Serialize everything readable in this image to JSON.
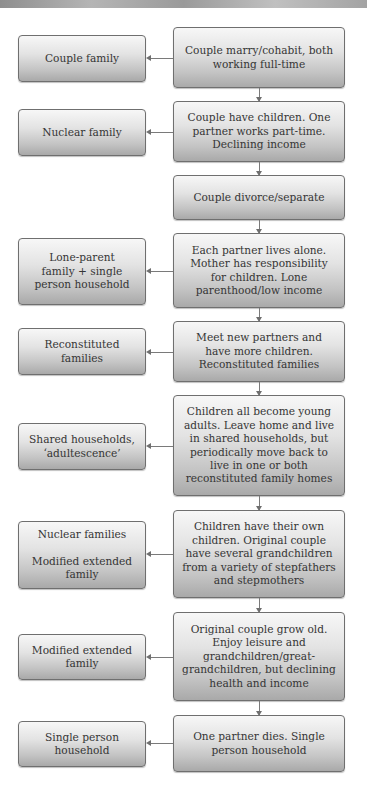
{
  "diagram": {
    "type": "flowchart",
    "stages": [
      {
        "stage": "Couple marry/cohabit, both\nworking full-time",
        "family_type": "Couple family"
      },
      {
        "stage": "Couple have children. One\npartner works part-time.\nDeclining income",
        "family_type": "Nuclear family"
      },
      {
        "stage": "Couple divorce/separate",
        "family_type": null
      },
      {
        "stage": "Each partner lives alone.\nMother has responsibility\nfor children. Lone\nparenthood/low income",
        "family_type": "Lone-parent\nfamily + single\nperson household"
      },
      {
        "stage": "Meet new partners and\nhave more children.\nReconstituted families",
        "family_type": "Reconstituted\nfamilies"
      },
      {
        "stage": "Children all become young\nadults. Leave home and live\nin shared households, but\nperiodically move back to\nlive in one or both\nreconstituted family homes",
        "family_type": "Shared households,\n‘adultescence’"
      },
      {
        "stage": "Children have their own\nchildren. Original couple\nhave several grandchildren\nfrom a variety of stepfathers\nand stepmothers",
        "family_type": "Nuclear families\n\nModified extended\nfamily"
      },
      {
        "stage": "Original couple grow old.\nEnjoy leisure and\ngrandchildren/great-\ngrandchildren, but declining\nhealth and income",
        "family_type": "Modified extended\nfamily"
      },
      {
        "stage": "One partner dies. Single\nperson household",
        "family_type": "Single person\nhousehold"
      }
    ]
  },
  "colors": {
    "box_border": "#6f6f6f",
    "box_gradient_top": "#f7f7f7",
    "box_gradient_bottom": "#a9a9a9",
    "text": "#353535",
    "connector": "#7a7a7a"
  }
}
